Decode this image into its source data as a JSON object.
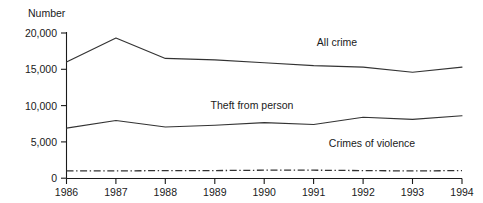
{
  "chart_data": {
    "type": "line",
    "title": "",
    "subtitle": "",
    "xlabel": "",
    "ylabel": "Number",
    "x": [
      1986,
      1987,
      1988,
      1989,
      1990,
      1991,
      1992,
      1993,
      1994
    ],
    "categories": [
      "1986",
      "1987",
      "1988",
      "1989",
      "1990",
      "1991",
      "1992",
      "1993",
      "1994"
    ],
    "xlim": [
      1986,
      1994
    ],
    "ylim": [
      0,
      20000
    ],
    "yticks": [
      0,
      5000,
      10000,
      15000,
      20000
    ],
    "ytick_labels": [
      "0",
      "5,000",
      "10,000",
      "15,000",
      "20,000"
    ],
    "xtick_labels": [
      "1986",
      "1987",
      "1988",
      "1989",
      "1990",
      "1991",
      "1992",
      "1993",
      "1994"
    ],
    "grid": false,
    "legend": "inline-annotations",
    "series": [
      {
        "name": "All crime",
        "label": "All crime",
        "style": "solid",
        "color": "#333333",
        "values": [
          16000,
          19300,
          16500,
          16300,
          15900,
          15500,
          15300,
          14600,
          15300
        ]
      },
      {
        "name": "Theft from person",
        "label": "Theft from person",
        "style": "solid",
        "color": "#333333",
        "values": [
          6900,
          7950,
          7050,
          7300,
          7650,
          7400,
          8400,
          8100,
          8600
        ]
      },
      {
        "name": "Crimes of violence",
        "label": "Crimes of violence",
        "style": "dash-dot",
        "color": "#333333",
        "values": [
          1000,
          1000,
          1050,
          1050,
          1100,
          1100,
          1050,
          1000,
          1050
        ]
      }
    ],
    "annotations": [
      {
        "text": "All crime",
        "x": 337,
        "y": 46
      },
      {
        "text": "Theft from person",
        "x": 252,
        "y": 109
      },
      {
        "text": "Crimes of violence",
        "x": 372,
        "y": 147
      }
    ]
  }
}
